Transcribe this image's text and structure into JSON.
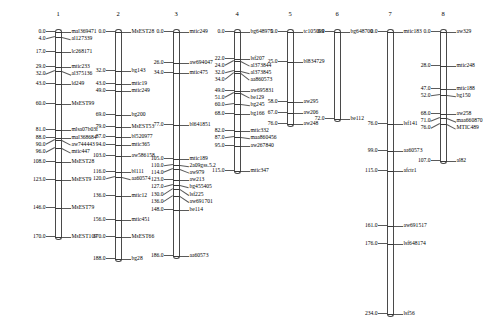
{
  "figure": {
    "type": "genetic-linkage-map",
    "units": "cM",
    "num_linkage_groups": 8
  },
  "linkage_groups": [
    {
      "name": "1",
      "x": 58,
      "length_cm": 170.0,
      "loci": [
        {
          "pos": "0.0",
          "marker": "mal369471"
        },
        {
          "pos": "4.0",
          "marker": "al127339"
        },
        {
          "pos": "17.0",
          "marker": "lc268171"
        },
        {
          "pos": "29.0",
          "marker": "mtic233"
        },
        {
          "pos": "32.0",
          "marker": "al375136"
        },
        {
          "pos": "43.0",
          "marker": "ld249"
        },
        {
          "pos": "60.0",
          "marker": "MsEST99"
        },
        {
          "pos": "81.0",
          "marker": "mlsa07b03f"
        },
        {
          "pos": "88.0",
          "marker": "mal368684"
        },
        {
          "pos": "90.0",
          "marker": "aw744443"
        },
        {
          "pos": "96.0",
          "marker": "mtic447"
        },
        {
          "pos": "108.0",
          "marker": "MsEST28"
        },
        {
          "pos": "123.0",
          "marker": "MsEST9"
        },
        {
          "pos": "146.0",
          "marker": "MsEST79"
        },
        {
          "pos": "170.0",
          "marker": "MsEST109"
        }
      ]
    },
    {
      "name": "2",
      "x": 118,
      "length_cm": 188.0,
      "loci": [
        {
          "pos": "0.0",
          "marker": "MsEST28"
        },
        {
          "pos": "32.0",
          "marker": "bg143"
        },
        {
          "pos": "43.0",
          "marker": "mtic19"
        },
        {
          "pos": "49.0",
          "marker": "mtic249"
        },
        {
          "pos": "69.0",
          "marker": "bg200"
        },
        {
          "pos": "79.0",
          "marker": "MsEST53"
        },
        {
          "pos": "87.0",
          "marker": "bl520977"
        },
        {
          "pos": "94.0",
          "marker": "mtic365"
        },
        {
          "pos": "103.0",
          "marker": "aw586158"
        },
        {
          "pos": "116.0",
          "marker": "bl111"
        },
        {
          "pos": "120.0",
          "marker": "aa60574"
        },
        {
          "pos": "136.0",
          "marker": "mtic12"
        },
        {
          "pos": "156.0",
          "marker": "mtic451"
        },
        {
          "pos": "170.0",
          "marker": "MsEST66"
        },
        {
          "pos": "188.0",
          "marker": "bg28"
        }
      ]
    },
    {
      "name": "3",
      "x": 176,
      "length_cm": 186.0,
      "loci": [
        {
          "pos": "0.0",
          "marker": "mtic249"
        },
        {
          "pos": "26.0",
          "marker": "aw694047"
        },
        {
          "pos": "34.0",
          "marker": "mtic475"
        },
        {
          "pos": "77.0",
          "marker": "bl641851"
        },
        {
          "pos": "105.0",
          "marker": "mtic189"
        },
        {
          "pos": "110.0",
          "marker": "2a09gss.5.2"
        },
        {
          "pos": "114.0",
          "marker": "aw979"
        },
        {
          "pos": "123.0",
          "marker": "aw213"
        },
        {
          "pos": "127.0",
          "marker": "bg455405"
        },
        {
          "pos": "130.0",
          "marker": "lsf225"
        },
        {
          "pos": "136.0",
          "marker": "aw691701"
        },
        {
          "pos": "148.0",
          "marker": "be114"
        },
        {
          "pos": "186.0",
          "marker": "aa60573"
        }
      ]
    },
    {
      "name": "4",
      "x": 237,
      "length_cm": 115.0,
      "loci": [
        {
          "pos": "0.0",
          "marker": "bg648975"
        },
        {
          "pos": "22.0",
          "marker": "lsf207"
        },
        {
          "pos": "24.0",
          "marker": "al373844"
        },
        {
          "pos": "32.0",
          "marker": "al373845"
        },
        {
          "pos": "34.0",
          "marker": "aa860573"
        },
        {
          "pos": "49.0",
          "marker": "aw695831"
        },
        {
          "pos": "51.0",
          "marker": "be129"
        },
        {
          "pos": "60.0",
          "marker": "bg245"
        },
        {
          "pos": "68.0",
          "marker": "bg166"
        },
        {
          "pos": "82.0",
          "marker": "mtic332"
        },
        {
          "pos": "87.0",
          "marker": "maa860456"
        },
        {
          "pos": "95.0",
          "marker": "aw267840"
        },
        {
          "pos": "115.0",
          "marker": "mtic347"
        }
      ]
    },
    {
      "name": "5",
      "x": 290,
      "length_cm": 76.0,
      "loci": [
        {
          "pos": "0.0",
          "marker": "tc105099"
        },
        {
          "pos": "25.0",
          "marker": "bl834729"
        },
        {
          "pos": "58.0",
          "marker": "aw295"
        },
        {
          "pos": "67.0",
          "marker": "aw206"
        },
        {
          "pos": "76.0",
          "marker": "aw248"
        }
      ]
    },
    {
      "name": "6",
      "x": 337,
      "length_cm": 72.0,
      "loci": [
        {
          "pos": "0.0",
          "marker": "bg648700"
        },
        {
          "pos": "72.0",
          "marker": "be112"
        }
      ]
    },
    {
      "name": "7",
      "x": 390,
      "length_cm": 234.0,
      "loci": [
        {
          "pos": "0.0",
          "marker": "mtic183"
        },
        {
          "pos": "76.0",
          "marker": "lsf141"
        },
        {
          "pos": "99.0",
          "marker": "aa60573"
        },
        {
          "pos": "115.0",
          "marker": "afctr1"
        },
        {
          "pos": "161.0",
          "marker": "aw691517"
        },
        {
          "pos": "176.0",
          "marker": "lsf648174"
        },
        {
          "pos": "234.0",
          "marker": "lsf56"
        }
      ]
    },
    {
      "name": "8",
      "x": 443,
      "length_cm": 107.0,
      "loci": [
        {
          "pos": "0.0",
          "marker": "aw329"
        },
        {
          "pos": "28.0",
          "marker": "mtic248"
        },
        {
          "pos": "47.0",
          "marker": "mtic188"
        },
        {
          "pos": "52.0",
          "marker": "bg150"
        },
        {
          "pos": "68.0",
          "marker": "aw258"
        },
        {
          "pos": "71.0",
          "marker": "maa660870"
        },
        {
          "pos": "76.0",
          "marker": "MTIC489"
        },
        {
          "pos": "107.0",
          "marker": "al82"
        }
      ]
    }
  ]
}
